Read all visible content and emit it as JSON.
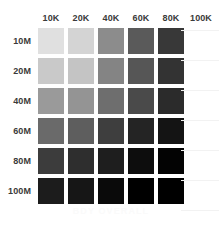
{
  "chart_data": {
    "type": "heatmap",
    "title": "",
    "caption": "BDY OVERALL",
    "xlabel": "",
    "ylabel": "",
    "x_tick_labels": [
      "10K",
      "20K",
      "40K",
      "60K",
      "80K",
      "100K"
    ],
    "y_tick_labels": [
      "10M",
      "20M",
      "40M",
      "60M",
      "80M",
      "100M"
    ],
    "legend": [],
    "grid": false,
    "colormap": "grayscale-light-to-dark",
    "empty_columns": [
      "100K"
    ],
    "note_empty": "The 100K column contains no swatches; header label only.",
    "rows": [
      {
        "label": "10M",
        "cells": [
          {
            "col": "10K",
            "color": "#e0e0e0",
            "value": 12
          },
          {
            "col": "20K",
            "color": "#d4d4d4",
            "value": 17
          },
          {
            "col": "40K",
            "color": "#8c8c8c",
            "value": 45
          },
          {
            "col": "60K",
            "color": "#5a5a5a",
            "value": 65
          },
          {
            "col": "80K",
            "color": "#383838",
            "value": 78
          },
          {
            "col": "100K",
            "color": null,
            "value": null
          }
        ]
      },
      {
        "label": "20M",
        "cells": [
          {
            "col": "10K",
            "color": "#c9c9c9",
            "value": 21
          },
          {
            "col": "20K",
            "color": "#c4c4c4",
            "value": 23
          },
          {
            "col": "40K",
            "color": "#848484",
            "value": 48
          },
          {
            "col": "60K",
            "color": "#565656",
            "value": 67
          },
          {
            "col": "80K",
            "color": "#333333",
            "value": 80
          },
          {
            "col": "100K",
            "color": null,
            "value": null
          }
        ]
      },
      {
        "label": "40M",
        "cells": [
          {
            "col": "10K",
            "color": "#9a9a9a",
            "value": 40
          },
          {
            "col": "20K",
            "color": "#949494",
            "value": 42
          },
          {
            "col": "40K",
            "color": "#6e6e6e",
            "value": 57
          },
          {
            "col": "60K",
            "color": "#4a4a4a",
            "value": 71
          },
          {
            "col": "80K",
            "color": "#2b2b2b",
            "value": 83
          },
          {
            "col": "100K",
            "color": null,
            "value": null
          }
        ]
      },
      {
        "label": "60M",
        "cells": [
          {
            "col": "10K",
            "color": "#6a6a6a",
            "value": 58
          },
          {
            "col": "20K",
            "color": "#5e5e5e",
            "value": 63
          },
          {
            "col": "40K",
            "color": "#3e3e3e",
            "value": 76
          },
          {
            "col": "60K",
            "color": "#242424",
            "value": 86
          },
          {
            "col": "80K",
            "color": "#141414",
            "value": 92
          },
          {
            "col": "100K",
            "color": null,
            "value": null
          }
        ]
      },
      {
        "label": "80M",
        "cells": [
          {
            "col": "10K",
            "color": "#3c3c3c",
            "value": 77
          },
          {
            "col": "20K",
            "color": "#2e2e2e",
            "value": 82
          },
          {
            "col": "40K",
            "color": "#1e1e1e",
            "value": 88
          },
          {
            "col": "60K",
            "color": "#0d0d0d",
            "value": 95
          },
          {
            "col": "80K",
            "color": "#030303",
            "value": 99
          },
          {
            "col": "100K",
            "color": null,
            "value": null
          }
        ]
      },
      {
        "label": "100M",
        "cells": [
          {
            "col": "10K",
            "color": "#1c1c1c",
            "value": 89
          },
          {
            "col": "20K",
            "color": "#161616",
            "value": 91
          },
          {
            "col": "40K",
            "color": "#0a0a0a",
            "value": 96
          },
          {
            "col": "60K",
            "color": "#000000",
            "value": 100
          },
          {
            "col": "80K",
            "color": "#000000",
            "value": 100
          },
          {
            "col": "100K",
            "color": null,
            "value": null
          }
        ]
      }
    ]
  }
}
